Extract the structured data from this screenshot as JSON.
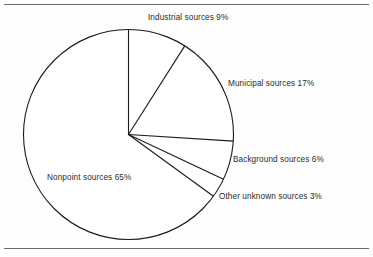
{
  "figure": {
    "name": "pollution-sources-pie-chart",
    "background_color": "#fdfdfd",
    "line_color": "#1a1a1a",
    "text_color": "#2b2b2b"
  },
  "rules": {
    "top_label": "",
    "bottom_label": ""
  },
  "chart_data": {
    "type": "pie",
    "title": "",
    "subtitle": "",
    "xlabel": "",
    "ylabel": "",
    "legend_position": "none",
    "grid": false,
    "start_angle_deg": 0,
    "direction": "clockwise",
    "labels": [
      "Industrial sources",
      "Municipal sources",
      "Background sources",
      "Other unknown sources",
      "Nonpoint sources"
    ],
    "values": [
      9,
      17,
      6,
      3,
      65
    ],
    "value_unit": "%",
    "total": 100,
    "annotations": [
      "Industrial sources 9%",
      "Municipal sources 17%",
      "Background sources 6%",
      "Other unknown sources 3%",
      "Nonpoint sources 65%"
    ],
    "slices": [
      {
        "label": "Industrial sources",
        "value": 9,
        "text": "Industrial sources 9%"
      },
      {
        "label": "Municipal sources",
        "value": 17,
        "text": "Municipal sources 17%"
      },
      {
        "label": "Background sources",
        "value": 6,
        "text": "Background sources 6%"
      },
      {
        "label": "Other unknown sources",
        "value": 3,
        "text": "Other unknown sources 3%"
      },
      {
        "label": "Nonpoint sources",
        "value": 65,
        "text": "Nonpoint sources 65%"
      }
    ]
  }
}
